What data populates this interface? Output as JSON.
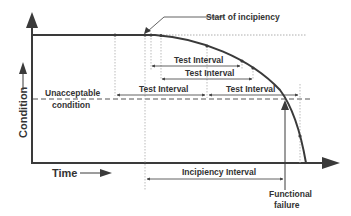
{
  "diagram": {
    "type": "pf_curve",
    "axes": {
      "x_label": "Time",
      "y_label": "Condition"
    },
    "labels": {
      "start_of_incipiency": "Start of incipiency",
      "unacceptable_line1": "Unacceptable",
      "unacceptable_line2": "condition",
      "functional_line1": "Functional",
      "functional_line2": "failure",
      "incipiency_interval": "Incipiency Interval"
    },
    "test_intervals": [
      {
        "label": "Test Interval",
        "row": 1
      },
      {
        "label": "Test Interval",
        "row": 2
      },
      {
        "label": "Test Interval",
        "row": 3
      },
      {
        "label": "Test Interval",
        "row": 3
      }
    ],
    "colors": {
      "line": "#3a3a3a",
      "text": "#333333",
      "guide": "#999999",
      "background": "#ffffff"
    }
  }
}
